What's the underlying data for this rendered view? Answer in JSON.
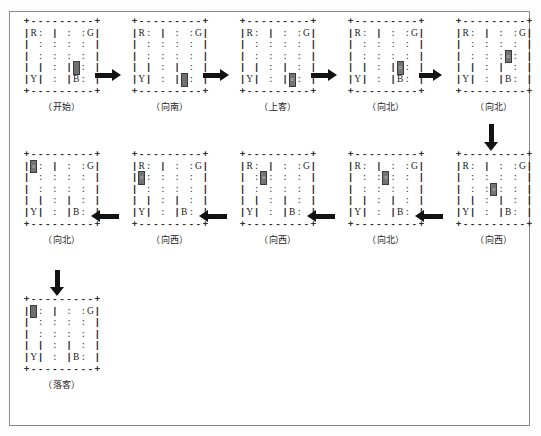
{
  "figure": {
    "title_present": false,
    "colors": {
      "ink": "#1d1d1d",
      "taxi": "#6f6f6f",
      "arrow": "#121212",
      "frame": "#8a8a8a"
    },
    "legend_marks": {
      "R": "R",
      "G": "G",
      "Y": "Y",
      "B": "B"
    },
    "grid_template": {
      "top_border": "+---------+",
      "bottom_border": "+---------+",
      "rows": [
        "|R: | : :G|",
        "| : : : : |",
        "| : : : : |",
        "| | : | : |",
        "|Y| : |B: |"
      ],
      "cols": 5,
      "rows_count": 5
    },
    "steps": [
      {
        "id": "s1",
        "caption": "（开始）",
        "taxi": {
          "row": 3,
          "col": 3
        },
        "passenger_onboard": false,
        "marks_visible": [
          "R",
          "G",
          "Y",
          "B"
        ]
      },
      {
        "id": "s2",
        "caption": "（向南）",
        "taxi": {
          "row": 4,
          "col": 3
        },
        "passenger_onboard": false,
        "marks_visible": [
          "R",
          "G",
          "Y"
        ]
      },
      {
        "id": "s3",
        "caption": "（上客）",
        "taxi": {
          "row": 4,
          "col": 3
        },
        "passenger_onboard": true,
        "marks_visible": [
          "R",
          "G",
          "Y"
        ]
      },
      {
        "id": "s4",
        "caption": "（向北）",
        "taxi": {
          "row": 3,
          "col": 3
        },
        "passenger_onboard": true,
        "marks_visible": [
          "R",
          "G",
          "Y",
          "B"
        ]
      },
      {
        "id": "s5",
        "caption": "（向北）",
        "taxi": {
          "row": 2,
          "col": 3
        },
        "passenger_onboard": true,
        "marks_visible": [
          "R",
          "G",
          "Y",
          "B"
        ]
      },
      {
        "id": "s6",
        "caption": "（向西）",
        "taxi": {
          "row": 2,
          "col": 2
        },
        "passenger_onboard": true,
        "marks_visible": [
          "R",
          "G",
          "Y",
          "B"
        ]
      },
      {
        "id": "s7",
        "caption": "（向北）",
        "taxi": {
          "row": 1,
          "col": 2
        },
        "passenger_onboard": true,
        "marks_visible": [
          "R",
          "G",
          "Y",
          "B"
        ]
      },
      {
        "id": "s8",
        "caption": "（向西）",
        "taxi": {
          "row": 1,
          "col": 1
        },
        "passenger_onboard": true,
        "marks_visible": [
          "R",
          "G",
          "Y",
          "B"
        ]
      },
      {
        "id": "s9",
        "caption": "（向西）",
        "taxi": {
          "row": 1,
          "col": 0
        },
        "passenger_onboard": true,
        "marks_visible": [
          "R",
          "G",
          "Y",
          "B"
        ]
      },
      {
        "id": "s10",
        "caption": "（向北）",
        "taxi": {
          "row": 0,
          "col": 0
        },
        "passenger_onboard": true,
        "marks_visible": [
          "R",
          "G",
          "Y",
          "B"
        ]
      },
      {
        "id": "s11",
        "caption": "（落客）",
        "taxi": {
          "row": 0,
          "col": 0
        },
        "passenger_onboard": false,
        "marks_visible": [
          "R",
          "G",
          "Y",
          "B"
        ]
      }
    ],
    "transitions": [
      {
        "from": "s1",
        "to": "s2",
        "direction": "right"
      },
      {
        "from": "s2",
        "to": "s3",
        "direction": "right"
      },
      {
        "from": "s3",
        "to": "s4",
        "direction": "right"
      },
      {
        "from": "s4",
        "to": "s5",
        "direction": "right"
      },
      {
        "from": "s5",
        "to": "s6",
        "direction": "down"
      },
      {
        "from": "s6",
        "to": "s7",
        "direction": "left"
      },
      {
        "from": "s7",
        "to": "s8",
        "direction": "left"
      },
      {
        "from": "s8",
        "to": "s9",
        "direction": "left"
      },
      {
        "from": "s9",
        "to": "s10",
        "direction": "left"
      },
      {
        "from": "s10",
        "to": "s11",
        "direction": "down"
      }
    ]
  }
}
